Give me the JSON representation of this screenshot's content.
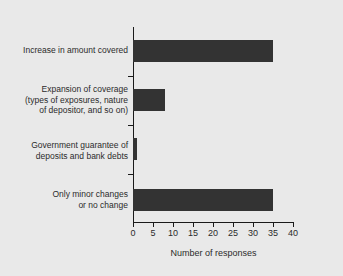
{
  "chart_data": {
    "type": "bar",
    "orientation": "horizontal",
    "title": "",
    "xlabel": "Number of responses",
    "ylabel": "",
    "xlim": [
      0,
      40
    ],
    "xticks": [
      0,
      5,
      10,
      15,
      20,
      25,
      30,
      35,
      40
    ],
    "grid": false,
    "legend": null,
    "bar_color": "#333333",
    "background_color": "#e9e9e9",
    "axis_color": "#1a1a1a",
    "categories": [
      "Increase in amount covered",
      "Expansion of coverage (types of exposures, nature of depositor, and so on)",
      "Government guarantee of deposits and bank debts",
      "Only minor changes or no change"
    ],
    "category_lines": [
      [
        "Increase in amount covered"
      ],
      [
        "Expansion of coverage",
        "(types of exposures, nature",
        "of depositor, and so on)"
      ],
      [
        "Government guarantee of",
        "deposits and bank debts"
      ],
      [
        "Only minor changes",
        "or no change"
      ]
    ],
    "values": [
      35,
      8,
      1,
      35
    ]
  }
}
